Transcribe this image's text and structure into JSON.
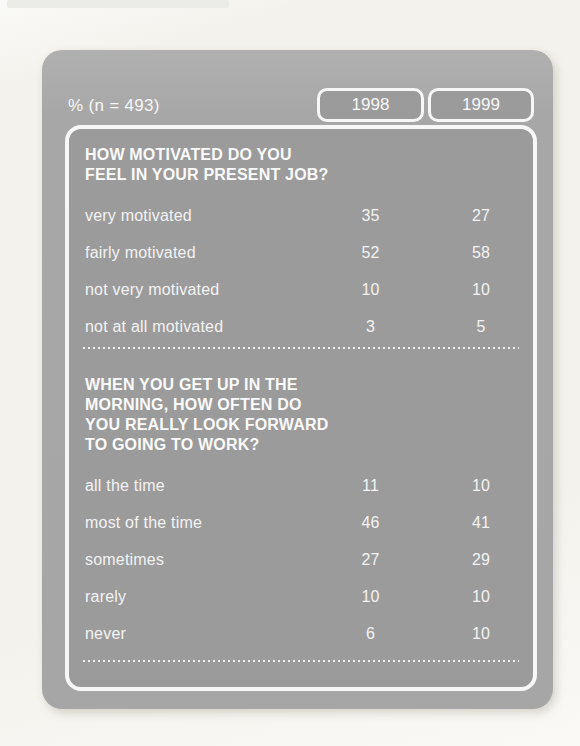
{
  "colors": {
    "page_background": "#f4f2ec",
    "figure_gray": "#a7a7a7",
    "panel_gray": "#9b9b9b",
    "text_white": "#f7f7f7"
  },
  "chart_data": {
    "type": "table",
    "sample_label": "% (n = 493)",
    "columns": [
      "1998",
      "1999"
    ],
    "sections": [
      {
        "question": "HOW MOTIVATED DO YOU\nFEEL IN YOUR PRESENT JOB?",
        "rows": [
          {
            "label": "very motivated",
            "values": [
              35,
              27
            ]
          },
          {
            "label": "fairly motivated",
            "values": [
              52,
              58
            ]
          },
          {
            "label": "not very motivated",
            "values": [
              10,
              10
            ]
          },
          {
            "label": "not at all motivated",
            "values": [
              3,
              5
            ]
          }
        ]
      },
      {
        "question": "WHEN YOU GET UP IN THE\nMORNING, HOW OFTEN DO\nYOU REALLY LOOK FORWARD\nTO GOING TO WORK?",
        "rows": [
          {
            "label": "all the time",
            "values": [
              11,
              10
            ]
          },
          {
            "label": "most of the time",
            "values": [
              46,
              41
            ]
          },
          {
            "label": "sometimes",
            "values": [
              27,
              29
            ]
          },
          {
            "label": "rarely",
            "values": [
              10,
              10
            ]
          },
          {
            "label": "never",
            "values": [
              6,
              10
            ]
          }
        ]
      }
    ]
  }
}
